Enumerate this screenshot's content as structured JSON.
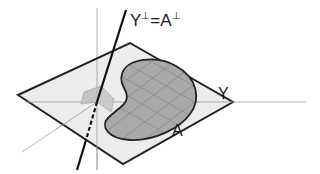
{
  "diagram": {
    "type": "geometric-illustration",
    "labels": {
      "perp_line": {
        "base": "Y",
        "sup1": "⊥",
        "eq": "=A",
        "sup2": "⊥",
        "full": "Y⊥=A⊥"
      },
      "plane": "Y",
      "region": "A"
    },
    "colors": {
      "background": "#ffffff",
      "plane_fill": "#ececec",
      "plane_stroke": "#222222",
      "region_fill": "#a9a9a9",
      "region_grid": "#8c8c8c",
      "region_stroke": "#222222",
      "axis": "#b5b5b5",
      "perp_line": "#111111",
      "small_square_fill": "#bdbdbd"
    }
  }
}
